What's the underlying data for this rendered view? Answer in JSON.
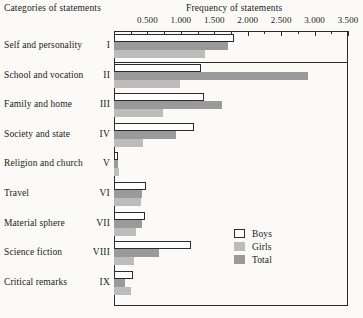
{
  "headers": {
    "categories_title": "Categories of statements",
    "frequency_title": "Frequency of statements"
  },
  "legend": {
    "items": [
      {
        "key": "boys",
        "label": "Boys"
      },
      {
        "key": "girls",
        "label": "Girls"
      },
      {
        "key": "total",
        "label": "Total"
      }
    ]
  },
  "colors": {
    "boys": "#ffffff",
    "girls": "#bcbcbc",
    "total": "#9a9a9a",
    "axis": "#2b2b2b",
    "background": "#fbfaf7"
  },
  "axis": {
    "tick_labels": [
      "0.500",
      "1.000",
      "1.500",
      "2.000",
      "2.500",
      "3.000",
      "3.500"
    ],
    "tick_values": [
      500,
      1000,
      1500,
      2000,
      2500,
      3000,
      3500
    ],
    "min": 0,
    "max": 3500
  },
  "chart_data": {
    "type": "bar",
    "orientation": "horizontal",
    "title": "Frequency of statements",
    "xlabel": "Frequency of statements",
    "ylabel": "Categories of statements",
    "xlim": [
      0,
      3500
    ],
    "grid": false,
    "legend_position": "bottom-right",
    "categories": [
      "Self and personality",
      "School and vocation",
      "Family and home",
      "Society and state",
      "Religion and church",
      "Travel",
      "Material sphere",
      "Science fiction",
      "Critical remarks"
    ],
    "category_numerals": [
      "I",
      "II",
      "III",
      "IV",
      "V",
      "VI",
      "VII",
      "VIII",
      "IX"
    ],
    "series": [
      {
        "name": "Boys",
        "values": [
          1800,
          1300,
          1350,
          1200,
          60,
          480,
          470,
          1150,
          290
        ]
      },
      {
        "name": "Girls",
        "values": [
          1360,
          990,
          740,
          430,
          70,
          400,
          330,
          300,
          250
        ]
      },
      {
        "name": "Total",
        "values": [
          1700,
          2900,
          1620,
          930,
          65,
          420,
          420,
          680,
          170
        ]
      }
    ],
    "bar_order": [
      "Boys",
      "Total",
      "Girls"
    ]
  }
}
